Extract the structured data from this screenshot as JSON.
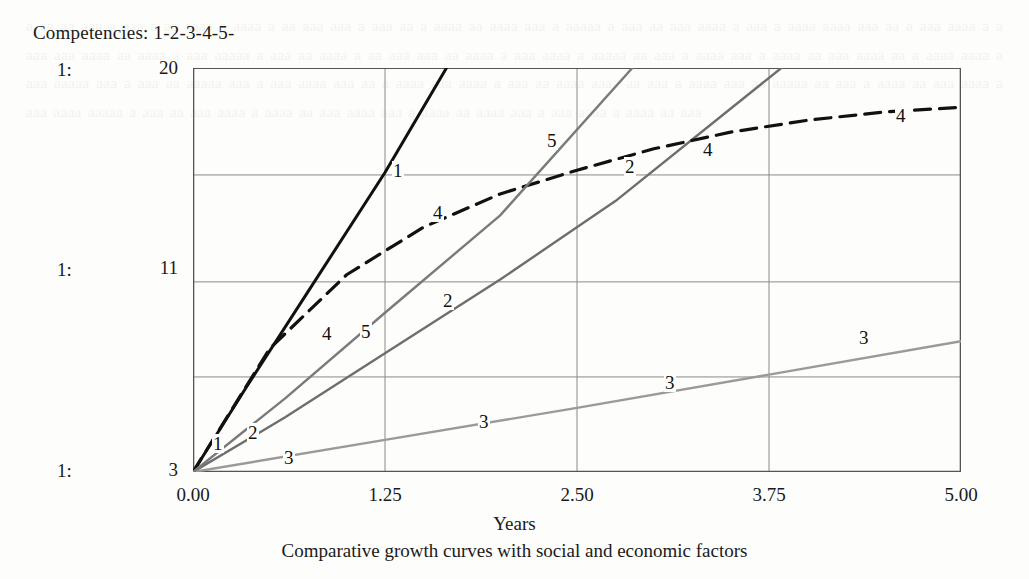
{
  "legend": {
    "text": "Competencies: 1-2-3-4-5-"
  },
  "axes": {
    "row_markers": [
      "1:",
      "1:",
      "1:"
    ],
    "y_ticks": [
      "20",
      "11",
      "3"
    ],
    "x_ticks": [
      "0.00",
      "1.25",
      "2.50",
      "3.75",
      "5.00"
    ],
    "x_title": "Years"
  },
  "caption": "Comparative growth curves with social and economic factors",
  "colors": {
    "curve1": "#111111",
    "curve2": "#6e6e6e",
    "curve3": "#9a9a9a",
    "curve4": "#111111",
    "curve5": "#7a7a7a",
    "grid": "#8a8a8a",
    "frame": "#555555",
    "paper": "#fdfdfb"
  },
  "curve_labels": [
    {
      "text": "1",
      "x": 212,
      "y": 434
    },
    {
      "text": "1",
      "x": 392,
      "y": 161
    },
    {
      "text": "2",
      "x": 247,
      "y": 423
    },
    {
      "text": "2",
      "x": 442,
      "y": 291
    },
    {
      "text": "2",
      "x": 624,
      "y": 157
    },
    {
      "text": "3",
      "x": 283,
      "y": 448
    },
    {
      "text": "3",
      "x": 478,
      "y": 412
    },
    {
      "text": "3",
      "x": 664,
      "y": 373
    },
    {
      "text": "3",
      "x": 858,
      "y": 328
    },
    {
      "text": "4",
      "x": 321,
      "y": 324
    },
    {
      "text": "4",
      "x": 432,
      "y": 203
    },
    {
      "text": "4",
      "x": 702,
      "y": 140
    },
    {
      "text": "4",
      "x": 895,
      "y": 106
    },
    {
      "text": "5",
      "x": 360,
      "y": 322
    },
    {
      "text": "5",
      "x": 546,
      "y": 131
    }
  ],
  "chart_data": {
    "type": "line",
    "title": "",
    "xlabel": "Years",
    "ylabel": "",
    "xlim": [
      0.0,
      5.0
    ],
    "ylim": [
      3,
      20
    ],
    "xticks": [
      0.0,
      1.25,
      2.5,
      3.75,
      5.0
    ],
    "yticks": [
      3,
      20
    ],
    "ytick_labels": [
      "3",
      "11",
      "20"
    ],
    "gridlines_y": [
      3,
      7,
      11,
      15.5,
      20
    ],
    "gridlines_x": [
      0.0,
      1.25,
      2.5,
      3.75,
      5.0
    ],
    "grid": true,
    "legend": "Competencies: 1-2-3-4-5-",
    "caption": "Comparative growth curves with social and economic factors",
    "series": [
      {
        "name": "1",
        "style": "solid",
        "color": "#111111",
        "width": 3.0,
        "points": [
          [
            0.0,
            3.0
          ],
          [
            0.35,
            6.6
          ],
          [
            0.75,
            10.6
          ],
          [
            1.25,
            15.6
          ],
          [
            1.65,
            20.0
          ]
        ]
      },
      {
        "name": "2",
        "style": "solid",
        "color": "#6e6e6e",
        "width": 2.4,
        "points": [
          [
            0.0,
            3.0
          ],
          [
            0.6,
            5.3
          ],
          [
            1.25,
            8.0
          ],
          [
            2.0,
            11.1
          ],
          [
            2.75,
            14.4
          ],
          [
            3.83,
            20.0
          ]
        ]
      },
      {
        "name": "3",
        "style": "solid",
        "color": "#9a9a9a",
        "width": 2.4,
        "points": [
          [
            0.0,
            3.0
          ],
          [
            1.25,
            4.35
          ],
          [
            2.5,
            5.7
          ],
          [
            3.75,
            7.1
          ],
          [
            5.0,
            8.5
          ]
        ]
      },
      {
        "name": "4",
        "style": "dashed",
        "color": "#111111",
        "width": 3.2,
        "points": [
          [
            0.0,
            3.0
          ],
          [
            0.5,
            8.2
          ],
          [
            1.0,
            11.3
          ],
          [
            1.5,
            13.3
          ],
          [
            2.0,
            14.7
          ],
          [
            2.5,
            15.7
          ],
          [
            3.0,
            16.6
          ],
          [
            3.5,
            17.3
          ],
          [
            4.0,
            17.8
          ],
          [
            4.5,
            18.15
          ],
          [
            5.0,
            18.35
          ]
        ]
      },
      {
        "name": "5",
        "style": "solid",
        "color": "#7a7a7a",
        "width": 2.4,
        "points": [
          [
            0.0,
            3.0
          ],
          [
            0.6,
            6.1
          ],
          [
            1.25,
            9.7
          ],
          [
            2.0,
            13.8
          ],
          [
            2.86,
            20.0
          ]
        ]
      }
    ]
  },
  "bleed_text": "a ca aa aaa a aaa a aa aaaa a aaaa a aa aaa aaa a aaa aa a aaaa aa aaaa aaa a aaaaa a aaa aa aaa aaaa a aaa a aaaa aaaa aaa aa a aaa aaaa a a aaa aaa aaaa aa aaaa a aaa aaaaa a aaa aa aaaa a aa aaa aaa aa aaaa a aaa aaaa a aaaaa aa aaa a aaaa aaa a aaaa aa aaa aaaa aa a aaaa aaaa a aaa aaaaa aaa a aaa aa aaaaa aaa a aaa aaaa aaa aa a aaaa aaa aaaa a aaa aa aaaa aaaa aa aaa a aaaa aaa aa aaaaa aa aaa a aaaa aa aaa aaaa a aaa aaaa aaaaa a aaa aa aaa aaaa a aaaa aa aaa aaaa aaa a aaaa aa aaaa aaa a aaa aaaa a aaaa aa aaa"
}
